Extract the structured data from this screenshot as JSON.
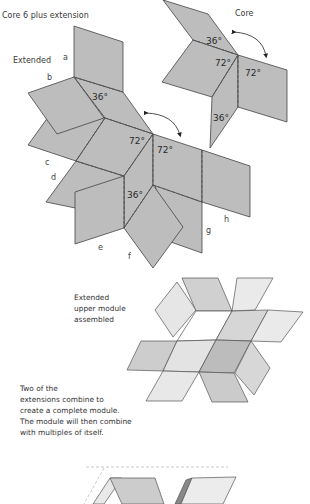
{
  "titles": {
    "core_plus": "Core 6 plus extension",
    "core": "Core",
    "extended": "Extended"
  },
  "panel_letters": [
    "a",
    "b",
    "c",
    "d",
    "e",
    "f",
    "g",
    "h"
  ],
  "angles": {
    "core": [
      "36°",
      "72°",
      "72°",
      "36°"
    ],
    "extended": [
      "36°",
      "72°",
      "72°",
      "36°"
    ]
  },
  "assembled_caption": [
    "Extended",
    "upper module",
    "assembled"
  ],
  "description": [
    "Two of the",
    "extensions combine to",
    "create a complete module.",
    "The module will then combine",
    "with multiples of itself."
  ],
  "colors": {
    "panel_fill": "#bdbdbd",
    "panel_stroke": "#444444",
    "fold_line": "#555555",
    "light_tile": "#e2e2e2",
    "mid_tile": "#c8c8c8",
    "dark_tile": "#a8a8a8"
  }
}
